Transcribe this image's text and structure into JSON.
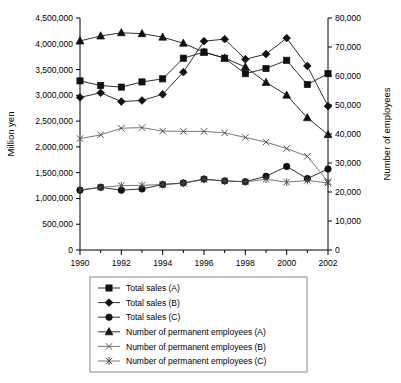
{
  "chart_data": {
    "type": "line",
    "title": "",
    "xlabel": "",
    "ylabel": "Million yen",
    "y2label": "Number of employees",
    "grid": false,
    "legend_position": "bottom",
    "x": [
      1990,
      1991,
      1992,
      1993,
      1994,
      1995,
      1996,
      1997,
      1998,
      1999,
      2000,
      2001,
      2002
    ],
    "xticks_major": [
      "1990",
      "1992",
      "1994",
      "1996",
      "1998",
      "2000",
      "2002"
    ],
    "xlim": [
      1990,
      2002
    ],
    "ylim": [
      0,
      4500000
    ],
    "yticks": [
      "0",
      "500,000",
      "1,000,000",
      "1,500,000",
      "2,000,000",
      "2,500,000",
      "3,000,000",
      "3,500,000",
      "4,000,000",
      "4,500,000"
    ],
    "y2lim": [
      0,
      80000
    ],
    "y2ticks": [
      "0",
      "10,000",
      "20,000",
      "30,000",
      "40,000",
      "50,000",
      "60,000",
      "70,000",
      "80,000"
    ],
    "series": [
      {
        "name": "Total sales (A)",
        "axis": "left",
        "marker": "square",
        "values": [
          3280000,
          3190000,
          3160000,
          3260000,
          3320000,
          3720000,
          3840000,
          3720000,
          3420000,
          3520000,
          3680000,
          3210000,
          3420000
        ]
      },
      {
        "name": "Total sales (B)",
        "axis": "left",
        "marker": "diamond",
        "values": [
          2960000,
          3050000,
          2880000,
          2900000,
          3020000,
          3450000,
          4050000,
          4090000,
          3700000,
          3800000,
          4110000,
          3570000,
          2790000
        ]
      },
      {
        "name": "Total sales (C)",
        "axis": "left",
        "marker": "circle",
        "values": [
          1160000,
          1215000,
          1160000,
          1185000,
          1270000,
          1300000,
          1375000,
          1340000,
          1325000,
          1430000,
          1620000,
          1385000,
          1570000
        ]
      },
      {
        "name": "Number of permanent employees (A)",
        "axis": "right",
        "marker": "triangle",
        "values": [
          72100,
          73800,
          74900,
          74600,
          73400,
          71300,
          68200,
          66200,
          63100,
          57800,
          53400,
          45600,
          39800
        ]
      },
      {
        "name": "Number of permanent employees (B)",
        "axis": "right",
        "marker": "cross",
        "values": [
          38400,
          39700,
          42000,
          42200,
          41000,
          40900,
          40900,
          40400,
          38800,
          37200,
          35000,
          32300,
          23600
        ]
      },
      {
        "name": "Number of permanent employees (C)",
        "axis": "right",
        "marker": "asterisk",
        "values": [
          20700,
          21600,
          22200,
          22300,
          22600,
          23000,
          24300,
          23800,
          23500,
          24400,
          23400,
          24000,
          23100
        ]
      }
    ]
  },
  "axes": {
    "left_title": "Million yen",
    "right_title": "Number of employees"
  },
  "legend": {
    "items": [
      {
        "label": "Total sales (A)",
        "marker": "square"
      },
      {
        "label": "Total sales (B)",
        "marker": "diamond"
      },
      {
        "label": "Total sales (C)",
        "marker": "circle"
      },
      {
        "label": "Number of permanent employees (A)",
        "marker": "triangle"
      },
      {
        "label": "Number of permanent employees (B)",
        "marker": "cross"
      },
      {
        "label": "Number of permanent employees (C)",
        "marker": "asterisk"
      }
    ]
  },
  "colors": {
    "ink": "#111111",
    "axis": "#000000",
    "legend_border": "#888888",
    "background": "#ffffff"
  }
}
